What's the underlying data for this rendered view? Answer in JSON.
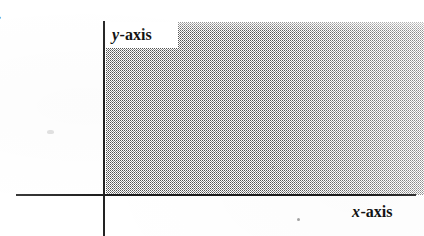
{
  "figure": {
    "list_label": ").",
    "caption": "",
    "background_color": "#ffffff",
    "ink_color": "#1c1c1c"
  },
  "axes": {
    "y_axis": {
      "label_variable": "y",
      "label_suffix": "-axis",
      "label_full": "y-axis"
    },
    "x_axis": {
      "label_variable": "x",
      "label_suffix": "-axis",
      "label_full": "x-axis"
    }
  },
  "shaded_region": {
    "description": "first quadrant",
    "fill_style": "stipple-halftone",
    "fill_color": "#282828"
  },
  "chart_data": {
    "type": "scatter",
    "title": "",
    "subtitle": "",
    "xlabel": "x-axis",
    "ylabel": "y-axis",
    "xlim": [
      0,
      1
    ],
    "ylim": [
      0,
      1
    ],
    "x": [],
    "y": [],
    "series": [],
    "grid": false,
    "legend": false,
    "legend_position": "none",
    "annotations": [
      {
        "text": "y-axis",
        "role": "axis-label",
        "position": "top-left, right of vertical axis"
      },
      {
        "text": "x-axis",
        "role": "axis-label",
        "position": "bottom-right, below horizontal axis"
      }
    ],
    "regions": [
      {
        "name": "first quadrant",
        "shading": "stippled grey halftone",
        "x_range": [
          0,
          1
        ],
        "y_range": [
          0,
          1
        ]
      }
    ]
  }
}
